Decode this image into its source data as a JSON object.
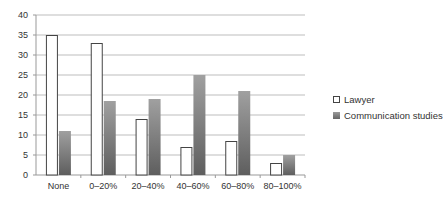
{
  "chart_data": {
    "type": "bar",
    "title": "",
    "xlabel": "",
    "ylabel": "",
    "ylim": [
      0,
      40
    ],
    "yticks": [
      0,
      5,
      10,
      15,
      20,
      25,
      30,
      35,
      40
    ],
    "grid": true,
    "legend_position": "right",
    "categories": [
      "None",
      "0–20%",
      "20–40%",
      "40–60%",
      "60–80%",
      "80–100%"
    ],
    "series": [
      {
        "name": "Lawyer",
        "color": "#ffffff",
        "border": "#444444",
        "values": [
          35,
          33,
          14,
          7,
          8.5,
          3
        ]
      },
      {
        "name": "Communication studies",
        "color": "#7a7a7a",
        "values": [
          11,
          18.5,
          19,
          25,
          21,
          5
        ]
      }
    ]
  },
  "legend": {
    "items": [
      {
        "label": "Lawyer"
      },
      {
        "label": "Communication studies"
      }
    ]
  }
}
